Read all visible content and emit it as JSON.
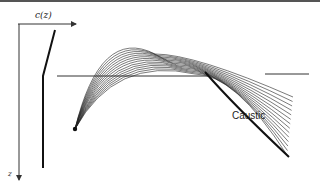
{
  "diagram": {
    "labels": {
      "speed_axis": "c(z)",
      "depth_axis": "z",
      "caustic": "Caustic"
    },
    "elements": [
      "sound-speed-profile",
      "source-point",
      "ray-fan",
      "reference-horizontal-line",
      "caustic"
    ],
    "colors": {
      "ink": "#222222",
      "border": "#555555"
    }
  }
}
